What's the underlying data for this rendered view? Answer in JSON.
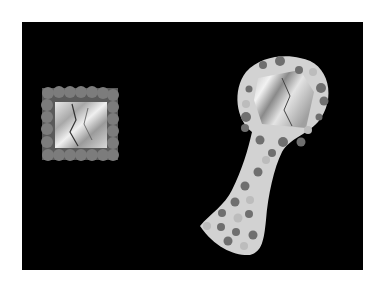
{
  "scene": {
    "description": "Black-and-white photo of two craft mirrors on a black background",
    "background": "#000000",
    "border": "#ffffff",
    "objects": [
      {
        "name": "square-mirror-frame",
        "type": "square frame with rounded bead border and crinkled foil center"
      },
      {
        "name": "hand-mirror",
        "type": "polka-dot hand mirror with crinkled foil center"
      }
    ]
  },
  "colors": {
    "frame_beads": "#7a7a7a",
    "foil": "#c8c8c8",
    "mirror_body": "#d4d4d4",
    "dots_dark": "#707070",
    "dots_light": "#bdbdbd"
  }
}
